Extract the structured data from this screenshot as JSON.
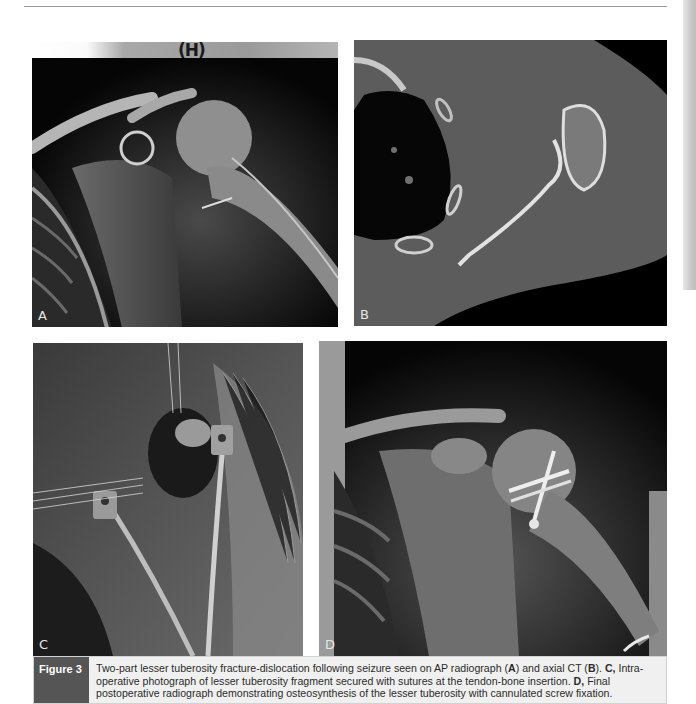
{
  "figure": {
    "label": "Figure 3",
    "panels": [
      {
        "id": "A",
        "letter": "A",
        "type": "AP radiograph",
        "marker": "(H)"
      },
      {
        "id": "B",
        "letter": "B",
        "type": "axial CT"
      },
      {
        "id": "C",
        "letter": "C",
        "type": "intraoperative photograph"
      },
      {
        "id": "D",
        "letter": "D",
        "type": "postoperative radiograph"
      }
    ],
    "caption": {
      "seg1": "Two-part lesser tuberosity fracture-dislocation following seizure seen on AP radiograph (",
      "ref_a": "A",
      "seg2": ") and axial CT (",
      "ref_b": "B",
      "seg3": "). ",
      "ref_c": "C,",
      "seg4": " Intra-operative photograph of lesser tuberosity fragment secured with sutures at the tendon-bone insertion. ",
      "ref_d": "D,",
      "seg5": " Final postoperative radiograph demonstrating osteosynthesis of the lesser tuberosity with cannulated screw fixation."
    }
  },
  "colors": {
    "caption_label_bg": "#555555",
    "caption_bg": "#f0f0f0",
    "header_rule": "#9a9a9a"
  }
}
